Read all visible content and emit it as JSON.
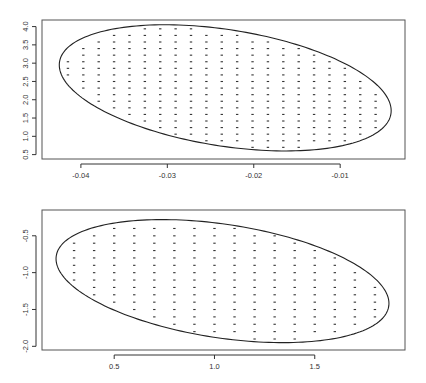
{
  "chart_data": [
    {
      "type": "scatter",
      "title": "",
      "xlabel": "",
      "ylabel": "",
      "xlim": [
        -0.0445,
        -0.0025
      ],
      "ylim": [
        0.38,
        4.18
      ],
      "xticks": [
        -0.04,
        -0.03,
        -0.02,
        -0.01
      ],
      "xtick_labels": [
        "-0.04",
        "-0.03",
        "-0.02",
        "-0.01"
      ],
      "yticks": [
        0.5,
        1.0,
        1.5,
        2.0,
        2.5,
        3.0,
        3.5,
        4.0
      ],
      "ytick_labels": [
        "0.5",
        "1.0",
        "1.5",
        "2.0",
        "2.5",
        "3.0",
        "3.5",
        "4.0"
      ],
      "grid": false,
      "ellipse": {
        "center": [
          -0.0233,
          2.32
        ],
        "x_extent": [
          -0.0425,
          -0.0041
        ],
        "y_extent": [
          0.6,
          4.05
        ],
        "tilt": "negative"
      },
      "points": {
        "description": "regular grid of points inside the ellipse",
        "x_step": 0.00178,
        "y_step": 0.18,
        "x_start": -0.0415,
        "y_start": 0.7
      }
    },
    {
      "type": "scatter",
      "title": "",
      "xlabel": "",
      "ylabel": "",
      "xlim": [
        0.14,
        1.95
      ],
      "ylim": [
        -2.05,
        -0.15
      ],
      "xticks": [
        0.5,
        1.0,
        1.5
      ],
      "xtick_labels": [
        "0.5",
        "1.0",
        "1.5"
      ],
      "yticks": [
        -0.5,
        -1.0,
        -1.5,
        -2.0
      ],
      "ytick_labels": [
        "-0.5",
        "-1.0",
        "-1.5",
        "-2.0"
      ],
      "grid": false,
      "ellipse": {
        "center": [
          1.04,
          -1.07
        ],
        "x_extent": [
          0.21,
          1.87
        ],
        "y_extent": [
          -1.95,
          -0.28
        ],
        "tilt": "negative"
      },
      "points": {
        "description": "regular grid of points inside the ellipse",
        "x_step": 0.1,
        "y_step": 0.1,
        "x_start": 0.3,
        "y_start": -1.9
      }
    }
  ]
}
